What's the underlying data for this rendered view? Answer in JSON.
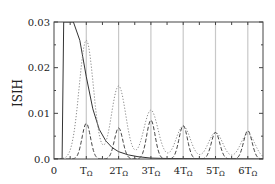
{
  "chart_data": {
    "type": "line",
    "title": "",
    "xlabel": "",
    "ylabel": "ISIH",
    "xlim": [
      0,
      6.5
    ],
    "ylim": [
      0,
      0.03
    ],
    "x_ticks": [
      {
        "value": 0,
        "label": "0"
      },
      {
        "value": 1,
        "label": "T",
        "sub": "Ω"
      },
      {
        "value": 2,
        "label": "2T",
        "sub": "Ω"
      },
      {
        "value": 3,
        "label": "3T",
        "sub": "Ω"
      },
      {
        "value": 4,
        "label": "4T",
        "sub": "Ω"
      },
      {
        "value": 5,
        "label": "5T",
        "sub": "Ω"
      },
      {
        "value": 6,
        "label": "6T",
        "sub": "Ω"
      }
    ],
    "y_ticks": [
      {
        "value": 0.0,
        "label": "0.0"
      },
      {
        "value": 0.01,
        "label": "0.01"
      },
      {
        "value": 0.02,
        "label": "0.02"
      },
      {
        "value": 0.03,
        "label": "0.03"
      }
    ],
    "grid": "vertical lines at multiples of T_Ω",
    "x_unit": "T_Ω",
    "series": [
      {
        "name": "solid",
        "style": "solid",
        "color": "#333333",
        "x": [
          0.0,
          0.25,
          0.3,
          0.35,
          0.6,
          0.8,
          1.0,
          1.2,
          1.4,
          1.6,
          1.8,
          2.0,
          2.3,
          2.6,
          3.0,
          3.5,
          6.5
        ],
        "y": [
          0.0,
          0.0,
          0.03,
          0.03,
          0.03,
          0.026,
          0.018,
          0.011,
          0.0065,
          0.004,
          0.0025,
          0.0016,
          0.0009,
          0.0005,
          0.0002,
          0.0001,
          0.0
        ]
      },
      {
        "name": "dotted",
        "style": "dotted",
        "color": "#888888",
        "peaks": [
          {
            "x": 1,
            "y": 0.026
          },
          {
            "x": 2,
            "y": 0.016
          },
          {
            "x": 3,
            "y": 0.0107
          },
          {
            "x": 4,
            "y": 0.0072
          },
          {
            "x": 5,
            "y": 0.0058
          },
          {
            "x": 6,
            "y": 0.0055
          }
        ]
      },
      {
        "name": "dashed",
        "style": "dashed",
        "color": "#444444",
        "peaks": [
          {
            "x": 1,
            "y": 0.0078
          },
          {
            "x": 2,
            "y": 0.0068
          },
          {
            "x": 3,
            "y": 0.0085
          },
          {
            "x": 4,
            "y": 0.0073
          },
          {
            "x": 5,
            "y": 0.0058
          },
          {
            "x": 6,
            "y": 0.0062
          }
        ]
      }
    ],
    "legend": null
  }
}
